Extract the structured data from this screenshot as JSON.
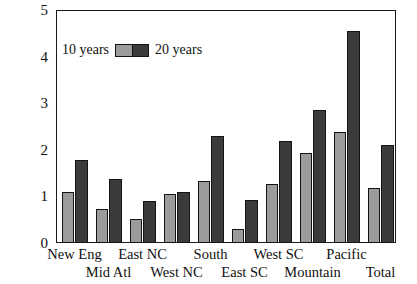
{
  "legend": {
    "left_label": "10 years",
    "right_label": "20 years",
    "swatch_name": "legend-swatch",
    "color_10": "#9b9b9b",
    "color_20": "#3b3b3b"
  },
  "axis": {
    "y_ticks": [
      "0",
      "1",
      "2",
      "3",
      "4",
      "5"
    ],
    "y_min": 0,
    "y_max": 5
  },
  "chart_data": {
    "type": "bar",
    "title": "",
    "xlabel": "",
    "ylabel": "",
    "ylim": [
      0,
      5
    ],
    "yticks": [
      0,
      1,
      2,
      3,
      4,
      5
    ],
    "grid": false,
    "legend_position": "top-left",
    "categories": [
      "New Eng",
      "Mid Atl",
      "East NC",
      "West NC",
      "South",
      "East SC",
      "West SC",
      "Mountain",
      "Pacific",
      "Total"
    ],
    "series": [
      {
        "name": "10 years",
        "color": "#9b9b9b",
        "values": [
          1.1,
          0.72,
          0.51,
          1.06,
          1.33,
          0.31,
          1.27,
          1.94,
          2.38,
          1.17
        ]
      },
      {
        "name": "20 years",
        "color": "#3b3b3b",
        "values": [
          1.78,
          1.37,
          0.9,
          1.09,
          2.29,
          0.93,
          2.19,
          2.86,
          4.56,
          2.1
        ]
      }
    ]
  }
}
